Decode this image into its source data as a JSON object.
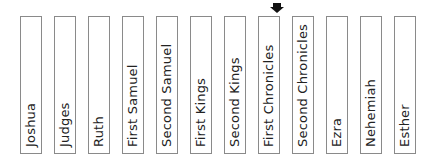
{
  "books": [
    {
      "label": "Joshua"
    },
    {
      "label": "Judges"
    },
    {
      "label": "Ruth"
    },
    {
      "label": "First Samuel"
    },
    {
      "label": "Second Samuel"
    },
    {
      "label": "First Kings"
    },
    {
      "label": "Second Kings"
    },
    {
      "label": "First Chronicles"
    },
    {
      "label": "Second Chronicles"
    },
    {
      "label": "Ezra"
    },
    {
      "label": "Nehemiah"
    },
    {
      "label": "Esther"
    }
  ],
  "marker": {
    "icon": "down-arrow-icon",
    "target_index": 8,
    "color": "#111111"
  }
}
